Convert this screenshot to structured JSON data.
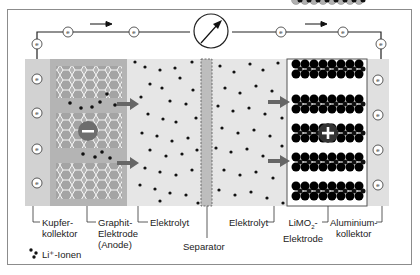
{
  "diagram": {
    "type": "lithium-ion battery discharge schematic",
    "circuit": {
      "meter_icon": "ammeter-gauge",
      "electron_symbol": "e",
      "current_direction": "left-to-right",
      "electron_count_top": 4,
      "electron_count_side": 2
    },
    "labels": {
      "kupfer": "Kupfer-",
      "kupfer2": "kollektor",
      "graphit": "Graphit-",
      "graphit2": "Elektrode",
      "graphit3": "(Anode)",
      "elektrolyt_left": "Elektrolyt",
      "separator": "Separator",
      "elektrolyt_right": "Elektrolyt",
      "limo2_a": "LiMO",
      "limo2_sub": "2",
      "limo2_b": "-",
      "limo2_2": "Elektrode",
      "alu": "Aluminium-",
      "alu2": "kollektor",
      "legend": "Li⁺-Ionen"
    },
    "symbols": {
      "anode_charge": "−",
      "cathode_charge": "+"
    },
    "colors": {
      "copper_collector": "#d2d2d2",
      "graphite_region": "#b4b4b4",
      "electrolyte": "#e4e4e4",
      "separator": "#bdbdbd",
      "aluminium_collector": "#e0e0e0",
      "ion": "#111111",
      "arrow": "#666666",
      "charge_circle": "#6e6e6e"
    }
  }
}
